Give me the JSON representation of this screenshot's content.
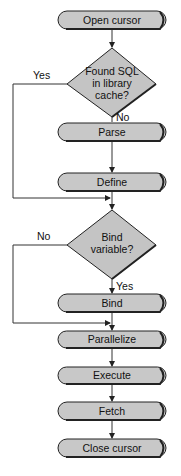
{
  "diagram": {
    "type": "flowchart",
    "steps": [
      {
        "id": "open_cursor",
        "label": "Open cursor",
        "shape": "terminal"
      },
      {
        "id": "found_sql",
        "label_lines": [
          "Found SQL",
          "in library",
          "cache?"
        ],
        "shape": "decision"
      },
      {
        "id": "parse",
        "label": "Parse",
        "shape": "terminal"
      },
      {
        "id": "define",
        "label": "Define",
        "shape": "terminal"
      },
      {
        "id": "bind_variable",
        "label_lines": [
          "Bind",
          "variable?"
        ],
        "shape": "decision"
      },
      {
        "id": "bind",
        "label": "Bind",
        "shape": "terminal"
      },
      {
        "id": "parallelize",
        "label": "Parallelize",
        "shape": "terminal"
      },
      {
        "id": "execute",
        "label": "Execute",
        "shape": "terminal"
      },
      {
        "id": "fetch",
        "label": "Fetch",
        "shape": "terminal"
      },
      {
        "id": "close_cursor",
        "label": "Close cursor",
        "shape": "terminal"
      }
    ],
    "edges": {
      "found_sql_yes": "Yes",
      "found_sql_no": "No",
      "bind_variable_no": "No",
      "bind_variable_yes": "Yes"
    }
  },
  "colors": {
    "shape_fill": "#c8c8c8",
    "stroke": "#222222",
    "background": "#ffffff"
  }
}
